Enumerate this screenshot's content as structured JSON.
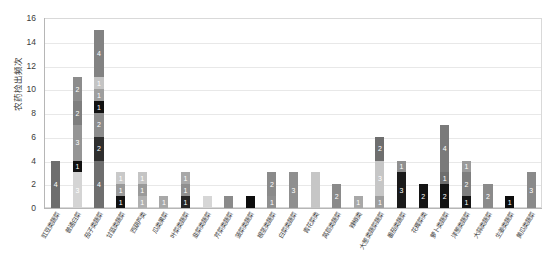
{
  "chart_data": {
    "type": "bar",
    "subtype": "stacked-bar",
    "title": "",
    "xlabel": "",
    "ylabel": "农药检出频次",
    "ylim": [
      0,
      16
    ],
    "ytick_values": [
      0,
      2,
      4,
      6,
      8,
      10,
      12,
      14,
      16
    ],
    "ytick_labels": [
      "0",
      "2",
      "4",
      "6",
      "8",
      "10",
      "12",
      "14",
      "16"
    ],
    "grid": true,
    "legend": false,
    "legend_position": "none",
    "categories": [
      "豇豆类蔬菜",
      "普通白菜",
      "茄子类蔬菜",
      "甘蓝类蔬菜",
      "西葫芦类",
      "瓜类果菜",
      "叶菜类蔬菜",
      "韭菜类蔬菜",
      "芹菜类蔬菜",
      "菠菜类蔬菜",
      "根茎类蔬菜",
      "白菜类蔬菜",
      "青花菜类",
      "莴苣类蔬菜",
      "辣椒类",
      "大葱类蔬菜蔬菜",
      "番茄类蔬菜",
      "花椰菜类",
      "萝卜类蔬菜",
      "洋葱类蔬菜",
      "大蒜类蔬菜",
      "生姜类蔬菜",
      "黄瓜类蔬菜"
    ],
    "bar_totals": [
      4,
      11,
      15,
      3,
      3,
      1,
      3,
      1,
      1,
      1,
      3,
      3,
      3,
      2,
      1,
      6,
      4,
      2,
      7,
      4,
      2,
      1,
      3
    ],
    "bars": [
      {
        "category": "豇豆类蔬菜",
        "total": 4,
        "segments": [
          {
            "value": 4,
            "label": "4",
            "color": "#6e6e6e",
            "text_color": "#ffffff"
          }
        ]
      },
      {
        "category": "普通白菜",
        "total": 11,
        "segments": [
          {
            "value": 3,
            "label": "3",
            "color": "#d4d4d4",
            "text_color": "#ffffff"
          },
          {
            "value": 1,
            "label": "1",
            "color": "#111111",
            "text_color": "#ffffff"
          },
          {
            "value": 3,
            "label": "3",
            "color": "#959595",
            "text_color": "#ffffff"
          },
          {
            "value": 2,
            "label": "2",
            "color": "#7e7e7e",
            "text_color": "#ffffff"
          },
          {
            "value": 2,
            "label": "2",
            "color": "#8c8c8c",
            "text_color": "#ffffff"
          }
        ]
      },
      {
        "category": "茄子类蔬菜",
        "total": 15,
        "segments": [
          {
            "value": 4,
            "label": "4",
            "color": "#6e6e6e",
            "text_color": "#ffffff"
          },
          {
            "value": 2,
            "label": "2",
            "color": "#2e2e2e",
            "text_color": "#ffffff"
          },
          {
            "value": 2,
            "label": "2",
            "color": "#8c8c8c",
            "text_color": "#ffffff"
          },
          {
            "value": 1,
            "label": "1",
            "color": "#111111",
            "text_color": "#ffffff"
          },
          {
            "value": 1,
            "label": "1",
            "color": "#9e9e9e",
            "text_color": "#ffffff"
          },
          {
            "value": 1,
            "label": "1",
            "color": "#c4c4c4",
            "text_color": "#ffffff"
          },
          {
            "value": 4,
            "label": "4",
            "color": "#828282",
            "text_color": "#ffffff"
          }
        ]
      },
      {
        "category": "甘蓝类蔬菜",
        "total": 3,
        "segments": [
          {
            "value": 1,
            "label": "1",
            "color": "#111111",
            "text_color": "#ffffff"
          },
          {
            "value": 1,
            "label": "1",
            "color": "#9a9a9a",
            "text_color": "#ffffff"
          },
          {
            "value": 1,
            "label": "1",
            "color": "#c9c9c9",
            "text_color": "#ffffff"
          }
        ]
      },
      {
        "category": "西葫芦类",
        "total": 3,
        "segments": [
          {
            "value": 1,
            "label": "1",
            "color": "#b0b0b0",
            "text_color": "#ffffff"
          },
          {
            "value": 1,
            "label": "1",
            "color": "#9a9a9a",
            "text_color": "#ffffff"
          },
          {
            "value": 1,
            "label": "1",
            "color": "#c4c4c4",
            "text_color": "#ffffff"
          }
        ]
      },
      {
        "category": "瓜类果菜",
        "total": 1,
        "segments": [
          {
            "value": 1,
            "label": "1",
            "color": "#a8a8a8",
            "text_color": "#ffffff"
          }
        ]
      },
      {
        "category": "叶菜类蔬菜",
        "total": 3,
        "segments": [
          {
            "value": 1,
            "label": "1",
            "color": "#262626",
            "text_color": "#ffffff"
          },
          {
            "value": 1,
            "label": "1",
            "color": "#8f8f8f",
            "text_color": "#ffffff"
          },
          {
            "value": 1,
            "label": "1",
            "color": "#a8a8a8",
            "text_color": "#ffffff"
          }
        ]
      },
      {
        "category": "韭菜类蔬菜",
        "total": 1,
        "segments": [
          {
            "value": 1,
            "label": "",
            "color": "#d6d6d6",
            "text_color": "#ffffff"
          }
        ]
      },
      {
        "category": "芹菜类蔬菜",
        "total": 1,
        "segments": [
          {
            "value": 1,
            "label": "",
            "color": "#8a8a8a",
            "text_color": "#ffffff"
          }
        ]
      },
      {
        "category": "菠菜类蔬菜",
        "total": 1,
        "segments": [
          {
            "value": 1,
            "label": "",
            "color": "#0d0d0d",
            "text_color": "#ffffff"
          }
        ]
      },
      {
        "category": "根茎类蔬菜",
        "total": 3,
        "segments": [
          {
            "value": 1,
            "label": "1",
            "color": "#8f8f8f",
            "text_color": "#ffffff"
          },
          {
            "value": 2,
            "label": "2",
            "color": "#8a8a8a",
            "text_color": "#ffffff"
          }
        ]
      },
      {
        "category": "白菜类蔬菜",
        "total": 3,
        "segments": [
          {
            "value": 3,
            "label": "3",
            "color": "#8f8f8f",
            "text_color": "#ffffff"
          }
        ]
      },
      {
        "category": "青花菜类",
        "total": 3,
        "segments": [
          {
            "value": 3,
            "label": "",
            "color": "#c6c6c6",
            "text_color": "#ffffff"
          }
        ]
      },
      {
        "category": "莴苣类蔬菜",
        "total": 2,
        "segments": [
          {
            "value": 2,
            "label": "2",
            "color": "#8a8a8a",
            "text_color": "#ffffff"
          }
        ]
      },
      {
        "category": "辣椒类",
        "total": 1,
        "segments": [
          {
            "value": 1,
            "label": "1",
            "color": "#a8a8a8",
            "text_color": "#ffffff"
          }
        ]
      },
      {
        "category": "大葱类蔬菜蔬菜",
        "total": 6,
        "segments": [
          {
            "value": 1,
            "label": "1",
            "color": "#9e9e9e",
            "text_color": "#ffffff"
          },
          {
            "value": 3,
            "label": "3",
            "color": "#c6c6c6",
            "text_color": "#ffffff"
          },
          {
            "value": 2,
            "label": "2",
            "color": "#6e6e6e",
            "text_color": "#ffffff"
          }
        ]
      },
      {
        "category": "番茄类蔬菜",
        "total": 4,
        "segments": [
          {
            "value": 3,
            "label": "3",
            "color": "#1a1a1a",
            "text_color": "#ffffff"
          },
          {
            "value": 1,
            "label": "1",
            "color": "#8f8f8f",
            "text_color": "#ffffff"
          }
        ]
      },
      {
        "category": "花椰菜类",
        "total": 2,
        "segments": [
          {
            "value": 2,
            "label": "2",
            "color": "#141414",
            "text_color": "#ffffff"
          }
        ]
      },
      {
        "category": "萝卜类蔬菜",
        "total": 7,
        "segments": [
          {
            "value": 2,
            "label": "2",
            "color": "#141414",
            "text_color": "#ffffff"
          },
          {
            "value": 1,
            "label": "1",
            "color": "#6e6e6e",
            "text_color": "#ffffff"
          },
          {
            "value": 4,
            "label": "4",
            "color": "#7a7a7a",
            "text_color": "#ffffff"
          }
        ]
      },
      {
        "category": "洋葱类蔬菜",
        "total": 4,
        "segments": [
          {
            "value": 1,
            "label": "1",
            "color": "#141414",
            "text_color": "#ffffff"
          },
          {
            "value": 2,
            "label": "2",
            "color": "#7e7e7e",
            "text_color": "#ffffff"
          },
          {
            "value": 1,
            "label": "1",
            "color": "#9a9a9a",
            "text_color": "#ffffff"
          }
        ]
      },
      {
        "category": "大蒜类蔬菜",
        "total": 2,
        "segments": [
          {
            "value": 2,
            "label": "2",
            "color": "#8a8a8a",
            "text_color": "#ffffff"
          }
        ]
      },
      {
        "category": "生姜类蔬菜",
        "total": 1,
        "segments": [
          {
            "value": 1,
            "label": "1",
            "color": "#0d0d0d",
            "text_color": "#ffffff"
          }
        ]
      },
      {
        "category": "黄瓜类蔬菜",
        "total": 3,
        "segments": [
          {
            "value": 3,
            "label": "3",
            "color": "#8a8a8a",
            "text_color": "#ffffff"
          }
        ]
      }
    ]
  },
  "style": {
    "plot_background": "#ffffff",
    "grid_color": "#e8e8e8",
    "axis_color": "#b6b6b6",
    "tick_text_color": "#3b3b3b",
    "axis_title_color": "#3b3b3b"
  }
}
